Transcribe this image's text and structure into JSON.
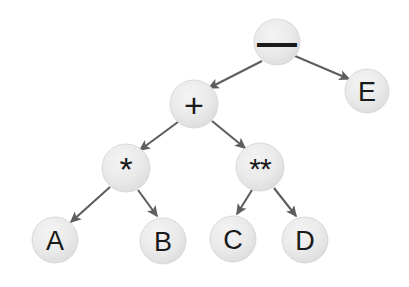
{
  "diagram": {
    "background_color": "#ffffff",
    "node_fill_color": "#e9e9e9",
    "node_stroke_color": "#d2d2d2",
    "edge_color": "#5e5e5e",
    "label_color": "#1a1a1a",
    "expression": "A * B + C ** D - E",
    "nodes": [
      {
        "id": "minus",
        "label": "—",
        "kind": "operator",
        "cx": 277,
        "cy": 42,
        "r": 23,
        "style": "op-minus"
      },
      {
        "id": "e",
        "label": "E",
        "kind": "operand",
        "cx": 367,
        "cy": 91,
        "r": 22,
        "style": "letter"
      },
      {
        "id": "plus",
        "label": "+",
        "kind": "operator",
        "cx": 194,
        "cy": 104,
        "r": 24,
        "style": "op-plus"
      },
      {
        "id": "star",
        "label": "*",
        "kind": "operator",
        "cx": 126,
        "cy": 168,
        "r": 24,
        "style": "op-star"
      },
      {
        "id": "dstar",
        "label": "**",
        "kind": "operator",
        "cx": 260,
        "cy": 167,
        "r": 24,
        "style": "op-dstar"
      },
      {
        "id": "a",
        "label": "A",
        "kind": "operand",
        "cx": 55,
        "cy": 240,
        "r": 23,
        "style": "letter"
      },
      {
        "id": "b",
        "label": "B",
        "kind": "operand",
        "cx": 163,
        "cy": 241,
        "r": 23,
        "style": "letter"
      },
      {
        "id": "c",
        "label": "C",
        "kind": "operand",
        "cx": 233,
        "cy": 239,
        "r": 23,
        "style": "letter"
      },
      {
        "id": "d",
        "label": "D",
        "kind": "operand",
        "cx": 305,
        "cy": 240,
        "r": 23,
        "style": "letter"
      }
    ],
    "edges": [
      {
        "id": "minus-plus",
        "from": "minus",
        "to": "plus",
        "x1": 262,
        "y1": 61,
        "x2": 209,
        "y2": 88,
        "directed": true
      },
      {
        "id": "minus-e",
        "from": "minus",
        "to": "e",
        "x1": 295,
        "y1": 56,
        "x2": 349,
        "y2": 79,
        "directed": true
      },
      {
        "id": "plus-star",
        "from": "plus",
        "to": "star",
        "x1": 178,
        "y1": 122,
        "x2": 140,
        "y2": 150,
        "directed": true
      },
      {
        "id": "plus-dstar",
        "from": "plus",
        "to": "dstar",
        "x1": 212,
        "y1": 121,
        "x2": 245,
        "y2": 148,
        "directed": true
      },
      {
        "id": "star-a",
        "from": "star",
        "to": "a",
        "x1": 110,
        "y1": 187,
        "x2": 71,
        "y2": 222,
        "directed": true
      },
      {
        "id": "star-b",
        "from": "star",
        "to": "b",
        "x1": 138,
        "y1": 190,
        "x2": 157,
        "y2": 216,
        "directed": true
      },
      {
        "id": "dstar-c",
        "from": "dstar",
        "to": "c",
        "x1": 252,
        "y1": 190,
        "x2": 237,
        "y2": 214,
        "directed": true
      },
      {
        "id": "dstar-d",
        "from": "dstar",
        "to": "d",
        "x1": 274,
        "y1": 188,
        "x2": 296,
        "y2": 216,
        "directed": true
      }
    ]
  }
}
